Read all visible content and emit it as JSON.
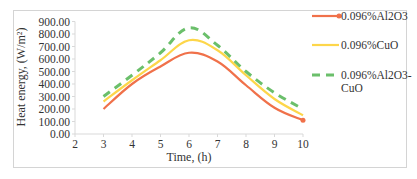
{
  "chart_data": {
    "type": "line",
    "title": "",
    "xlabel": "Time, (h)",
    "ylabel": "Heat energy, (W/m²)",
    "xlim": [
      2,
      10
    ],
    "ylim": [
      0,
      900
    ],
    "x_ticks": [
      "2",
      "3",
      "4",
      "5",
      "6",
      "7",
      "8",
      "9",
      "10"
    ],
    "y_ticks": [
      "0.00",
      "100.00",
      "200.00",
      "300.00",
      "400.00",
      "500.00",
      "600.00",
      "700.00",
      "800.00",
      "900.00"
    ],
    "grid": false,
    "legend_position": "right",
    "x": [
      3,
      4,
      5,
      6,
      7,
      8,
      9,
      10
    ],
    "series": [
      {
        "name": "0.096%Al2O3",
        "color": "#f0714a",
        "style": "solid-marker",
        "values": [
          200,
          400,
          540,
          650,
          580,
          390,
          210,
          110
        ]
      },
      {
        "name": "0.096%CuO",
        "color": "#fdd64a",
        "style": "solid",
        "values": [
          260,
          430,
          590,
          750,
          670,
          470,
          280,
          150
        ]
      },
      {
        "name": "0.096%Al2O3-CuO",
        "color": "#6bbf6b",
        "style": "dashed",
        "values": [
          300,
          470,
          650,
          850,
          710,
          500,
          330,
          200
        ]
      }
    ]
  },
  "legend": {
    "items": [
      {
        "line1": "0.096%Al2O3",
        "line2": ""
      },
      {
        "line1": "0.096%CuO",
        "line2": ""
      },
      {
        "line1": "0.096%Al2O3-",
        "line2": "CuO"
      }
    ]
  }
}
